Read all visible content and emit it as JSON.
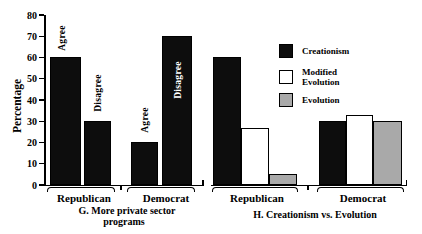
{
  "figure": {
    "background": "#ffffff",
    "ink": "#000000",
    "ylabel": "Percentage",
    "yticks": [
      0,
      10,
      20,
      30,
      40,
      50,
      60,
      70,
      80
    ],
    "ymax": 80,
    "colors": {
      "black_bar": "#0d0d0d",
      "white_bar": "#ffffff",
      "gray_bar": "#a9a9a9"
    }
  },
  "chart_data": [
    {
      "type": "bar",
      "panel": "G",
      "title": "G. More private sector programs",
      "title_lines": [
        "G. More private sector",
        "programs"
      ],
      "ylabel": "Percentage",
      "ylim": [
        0,
        80
      ],
      "grid": false,
      "categories": [
        "Republican",
        "Democrat"
      ],
      "series": [
        {
          "name": "Agree",
          "color": "#0d0d0d",
          "values": [
            60,
            20
          ]
        },
        {
          "name": "Disagree",
          "color": "#0d0d0d",
          "values": [
            30,
            70
          ]
        }
      ],
      "bar_labels": [
        {
          "text": "Agree",
          "group": "Republican",
          "placement": "above-bar",
          "color": "#000000"
        },
        {
          "text": "Disagree",
          "group": "Republican",
          "placement": "above-bar",
          "color": "#000000"
        },
        {
          "text": "Agree",
          "group": "Democrat",
          "placement": "above-bar",
          "color": "#000000"
        },
        {
          "text": "Disagree",
          "group": "Democrat",
          "placement": "inside-bar",
          "color": "#ffffff"
        }
      ]
    },
    {
      "type": "bar",
      "panel": "H",
      "title": "H. Creationism vs. Evolution",
      "ylim": [
        0,
        80
      ],
      "grid": false,
      "categories": [
        "Republican",
        "Democrat"
      ],
      "series": [
        {
          "name": "Creationism",
          "color": "#0d0d0d",
          "values": [
            60,
            30
          ]
        },
        {
          "name": "Modified Evolution",
          "color": "#ffffff",
          "values": [
            27,
            33
          ]
        },
        {
          "name": "Evolution",
          "color": "#a9a9a9",
          "values": [
            5,
            30
          ]
        }
      ],
      "legend_position": "upper right",
      "legend": [
        {
          "label": "Creationism",
          "lines": [
            "Creationism"
          ],
          "color": "#0d0d0d"
        },
        {
          "label": "Modified Evolution",
          "lines": [
            "Modified",
            "Evolution"
          ],
          "color": "#ffffff"
        },
        {
          "label": "Evolution",
          "lines": [
            "Evolution"
          ],
          "color": "#a9a9a9"
        }
      ]
    }
  ]
}
